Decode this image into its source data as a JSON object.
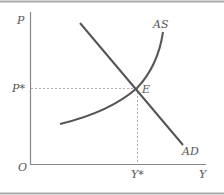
{
  "diagram": {
    "type": "AD-AS equilibrium diagram",
    "axes": {
      "y_label": "P",
      "x_label": "Y",
      "origin_label": "O"
    },
    "equilibrium": {
      "point_label": "E",
      "price_label": "P*",
      "output_label": "Y*"
    },
    "curves": [
      {
        "name": "AS",
        "label": "AS",
        "shape": "upward-sloping convex curve"
      },
      {
        "name": "AD",
        "label": "AD",
        "shape": "downward-sloping line"
      }
    ],
    "colors": {
      "axis": "#888888",
      "curve": "#555555",
      "dashed": "#999999",
      "border": "#aaaaaa",
      "text": "#555555"
    }
  }
}
